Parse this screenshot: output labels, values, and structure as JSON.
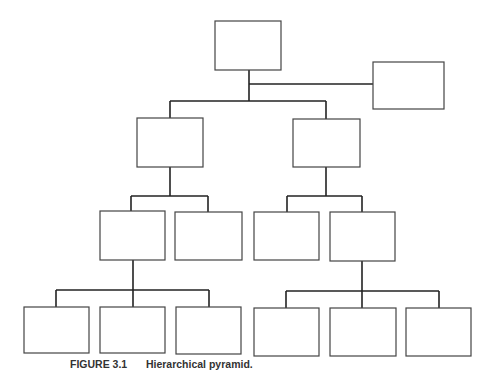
{
  "caption": {
    "label": "FIGURE 3.1",
    "title": "Hierarchical pyramid."
  },
  "diagram": {
    "type": "org-chart",
    "nodes": [
      {
        "id": "root",
        "level": 0,
        "x": 215,
        "y": 21,
        "w": 66,
        "h": 49
      },
      {
        "id": "staff",
        "level": 0,
        "x": 373,
        "y": 62,
        "w": 71,
        "h": 47
      },
      {
        "id": "l1-left",
        "level": 1,
        "x": 137,
        "y": 118,
        "w": 66,
        "h": 49
      },
      {
        "id": "l1-right",
        "level": 1,
        "x": 293,
        "y": 119,
        "w": 67,
        "h": 48
      },
      {
        "id": "l2-a",
        "level": 2,
        "x": 100,
        "y": 211,
        "w": 65,
        "h": 49
      },
      {
        "id": "l2-b",
        "level": 2,
        "x": 175,
        "y": 212,
        "w": 67,
        "h": 48
      },
      {
        "id": "l2-c",
        "level": 2,
        "x": 254,
        "y": 212,
        "w": 65,
        "h": 48
      },
      {
        "id": "l2-d",
        "level": 2,
        "x": 330,
        "y": 212,
        "w": 65,
        "h": 49
      },
      {
        "id": "l3-a",
        "level": 3,
        "x": 24,
        "y": 307,
        "w": 65,
        "h": 46
      },
      {
        "id": "l3-b",
        "level": 3,
        "x": 100,
        "y": 307,
        "w": 65,
        "h": 46
      },
      {
        "id": "l3-c",
        "level": 3,
        "x": 176,
        "y": 307,
        "w": 65,
        "h": 47
      },
      {
        "id": "l3-d",
        "level": 3,
        "x": 254,
        "y": 308,
        "w": 65,
        "h": 48
      },
      {
        "id": "l3-e",
        "level": 3,
        "x": 330,
        "y": 308,
        "w": 66,
        "h": 48
      },
      {
        "id": "l3-f",
        "level": 3,
        "x": 406,
        "y": 308,
        "w": 65,
        "h": 48
      }
    ],
    "edges": [
      [
        "root",
        "staff"
      ],
      [
        "root",
        "l1-left"
      ],
      [
        "root",
        "l1-right"
      ],
      [
        "l1-left",
        "l2-a"
      ],
      [
        "l1-left",
        "l2-b"
      ],
      [
        "l1-right",
        "l2-c"
      ],
      [
        "l1-right",
        "l2-d"
      ],
      [
        "l2-a",
        "l3-a"
      ],
      [
        "l2-a",
        "l3-b"
      ],
      [
        "l2-a",
        "l3-c"
      ],
      [
        "l2-d",
        "l3-d"
      ],
      [
        "l2-d",
        "l3-e"
      ],
      [
        "l2-d",
        "l3-f"
      ]
    ]
  }
}
